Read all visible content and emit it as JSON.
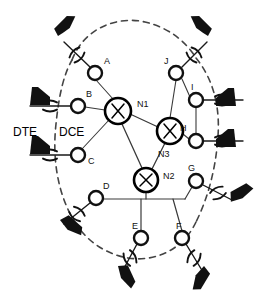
{
  "diagram": {
    "title": "",
    "type": "network-topology",
    "colors": {
      "line": "#3a3a3a",
      "node_stroke": "#111111",
      "node_fill": "#ffffff",
      "switch_stroke": "#000000",
      "terminal_fill": "#111111",
      "dashed_cloud": "#444444",
      "label": "#111111"
    },
    "legend": {
      "dte_label": "DTE",
      "dce_label": "DCE"
    },
    "switches": [
      {
        "id": "N1",
        "label": "N1",
        "cx": 118,
        "cy": 111,
        "r": 13,
        "label_x": 138,
        "label_y": 107
      },
      {
        "id": "N2",
        "label": "N2",
        "cx": 146,
        "cy": 180,
        "r": 12,
        "label_x": 164,
        "label_y": 178
      },
      {
        "id": "N3",
        "label": "N3",
        "cx": 170,
        "cy": 131,
        "r": 13,
        "label_x": 160,
        "label_y": 157
      }
    ],
    "access_nodes": [
      {
        "id": "A",
        "label": "A",
        "cx": 95,
        "cy": 73,
        "r": 7,
        "label_x": 104,
        "label_y": 64
      },
      {
        "id": "B",
        "label": "B",
        "cx": 78,
        "cy": 106,
        "r": 7,
        "label_x": 86,
        "label_y": 97
      },
      {
        "id": "C",
        "label": "C",
        "cx": 78,
        "cy": 155,
        "r": 7,
        "label_x": 88,
        "label_y": 164
      },
      {
        "id": "D",
        "label": "D",
        "cx": 96,
        "cy": 198,
        "r": 7,
        "label_x": 103,
        "label_y": 189
      },
      {
        "id": "E",
        "label": "E",
        "cx": 141,
        "cy": 238,
        "r": 7,
        "label_x": 133,
        "label_y": 229
      },
      {
        "id": "F",
        "label": "F",
        "cx": 182,
        "cy": 238,
        "r": 7,
        "label_x": 178,
        "label_y": 229
      },
      {
        "id": "G",
        "label": "G",
        "cx": 196,
        "cy": 181,
        "r": 7,
        "label_x": 189,
        "label_y": 171
      },
      {
        "id": "H",
        "label": "H",
        "cx": 196,
        "cy": 141,
        "r": 7,
        "label_x": 181,
        "label_y": 131
      },
      {
        "id": "I",
        "label": "I",
        "cx": 196,
        "cy": 100,
        "r": 7,
        "label_x": 191,
        "label_y": 90
      },
      {
        "id": "J",
        "label": "J",
        "cx": 176,
        "cy": 73,
        "r": 7,
        "label_x": 165,
        "label_y": 64
      }
    ],
    "links": [
      {
        "from": "A",
        "to": "N1"
      },
      {
        "from": "B",
        "to": "N1"
      },
      {
        "from": "C",
        "to": "N1"
      },
      {
        "from": "N1",
        "to": "N3"
      },
      {
        "from": "N1",
        "to": "N2"
      },
      {
        "from": "N2",
        "to": "N3"
      },
      {
        "from": "J",
        "to": "N3"
      },
      {
        "from": "I",
        "to": "J"
      },
      {
        "from": "I",
        "to": "H"
      },
      {
        "from": "H",
        "to": "N3"
      },
      {
        "from": "D",
        "to": "bus"
      },
      {
        "from": "E",
        "to": "bus"
      },
      {
        "from": "F",
        "to": "bus"
      },
      {
        "from": "G",
        "to": "bus"
      },
      {
        "from": "N2",
        "to": "bus"
      }
    ],
    "terminals": [
      {
        "for_node": "A",
        "name": "terminal-a",
        "x": 58,
        "y": 36,
        "rot": 35,
        "side": "left"
      },
      {
        "for_node": "B",
        "name": "terminal-b",
        "x": 20,
        "y": 98,
        "rot": 0,
        "side": "left"
      },
      {
        "for_node": "C",
        "name": "terminal-c",
        "x": 20,
        "y": 148,
        "rot": 0,
        "side": "left"
      },
      {
        "for_node": "D",
        "name": "terminal-d",
        "x": 58,
        "y": 212,
        "rot": 145,
        "side": "left"
      },
      {
        "for_node": "E",
        "name": "terminal-e",
        "x": 118,
        "y": 268,
        "rot": 125,
        "side": "left"
      },
      {
        "for_node": "F",
        "name": "terminal-f",
        "x": 206,
        "y": 268,
        "rot": 55,
        "side": "right"
      },
      {
        "for_node": "G",
        "name": "terminal-g",
        "x": 244,
        "y": 196,
        "rot": 35,
        "side": "right"
      },
      {
        "for_node": "H",
        "name": "terminal-h",
        "x": 244,
        "y": 141,
        "rot": 0,
        "side": "right"
      },
      {
        "for_node": "I",
        "name": "terminal-i",
        "x": 244,
        "y": 100,
        "rot": 0,
        "side": "right"
      },
      {
        "for_node": "J",
        "name": "terminal-j",
        "x": 206,
        "y": 36,
        "rot": 145,
        "side": "right"
      }
    ],
    "dce_interfaces": [
      {
        "for_node": "A",
        "name": "dce-a"
      },
      {
        "for_node": "B",
        "name": "dce-b"
      },
      {
        "for_node": "C",
        "name": "dce-c"
      },
      {
        "for_node": "D",
        "name": "dce-d"
      },
      {
        "for_node": "E",
        "name": "dce-e"
      },
      {
        "for_node": "F",
        "name": "dce-f"
      },
      {
        "for_node": "G",
        "name": "dce-g"
      },
      {
        "for_node": "H",
        "name": "dce-h"
      },
      {
        "for_node": "I",
        "name": "dce-i"
      },
      {
        "for_node": "J",
        "name": "dce-j"
      }
    ]
  }
}
